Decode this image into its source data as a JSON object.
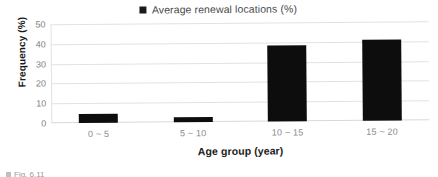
{
  "chart_data": {
    "type": "bar",
    "title": "",
    "categories": [
      "0 ~ 5",
      "5 ~ 10",
      "10 ~ 15",
      "15 ~ 20"
    ],
    "values": [
      4.5,
      2.5,
      38.5,
      41
    ],
    "series": [
      {
        "name": "Average renewal locations (%)",
        "values": [
          4.5,
          2.5,
          38.5,
          41
        ]
      }
    ],
    "xlabel": "Age group (year)",
    "ylabel": "Frequency (%)",
    "ylim": [
      0,
      50
    ],
    "yticks": [
      "0",
      "10",
      "20",
      "30",
      "40",
      "50"
    ],
    "ytick_values": [
      0,
      10,
      20,
      30,
      40,
      50
    ],
    "grid": "horizontal",
    "legend": {
      "position": "top-center",
      "entries": [
        {
          "label": "Average renewal locations (%)",
          "color": "#1a1a1a"
        }
      ]
    },
    "bar_color": "#0d0d0d",
    "gridline_color": "#e2e2e2",
    "tick_label_color": "#808080"
  },
  "caption": {
    "text": "Fig. 6.11"
  }
}
